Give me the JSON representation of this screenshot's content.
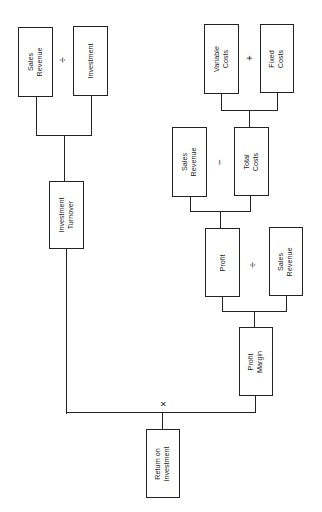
{
  "diagram": {
    "title": "",
    "orientation": "rotated 90° counter-clockwise (root at bottom)",
    "nodes": {
      "roi": {
        "line1": "Return on",
        "line2": "Investment"
      },
      "investment_turnover": {
        "line1": "Investment",
        "line2": "Turnover"
      },
      "profit_margin": {
        "line1": "Profit",
        "line2": "Margin"
      },
      "it_sales_revenue": {
        "line1": "Sales",
        "line2": "Revenue"
      },
      "it_investment": {
        "line1": "Investment",
        "line2": ""
      },
      "pm_profit": {
        "line1": "Profit",
        "line2": ""
      },
      "pm_sales_revenue": {
        "line1": "Sales",
        "line2": "Revenue"
      },
      "p_sales_revenue": {
        "line1": "Sales",
        "line2": "Revenue"
      },
      "p_total_costs": {
        "line1": "Total",
        "line2": "Costs"
      },
      "tc_variable_costs": {
        "line1": "Variable",
        "line2": "Costs"
      },
      "tc_fixed_costs": {
        "line1": "Fixed",
        "line2": "Costs"
      }
    },
    "operators": {
      "roi": "×",
      "investment_turnover": "÷",
      "profit_margin": "÷",
      "profit": "−",
      "total_costs": "+"
    },
    "edges": [
      {
        "parent": "Return on Investment",
        "children": [
          "Investment Turnover",
          "Profit Margin"
        ],
        "op": "×"
      },
      {
        "parent": "Investment Turnover",
        "children": [
          "Sales Revenue",
          "Investment"
        ],
        "op": "÷"
      },
      {
        "parent": "Profit Margin",
        "children": [
          "Profit",
          "Sales Revenue"
        ],
        "op": "÷"
      },
      {
        "parent": "Profit",
        "children": [
          "Sales Revenue",
          "Total Costs"
        ],
        "op": "−"
      },
      {
        "parent": "Total Costs",
        "children": [
          "Variable Costs",
          "Fixed Costs"
        ],
        "op": "+"
      }
    ]
  }
}
